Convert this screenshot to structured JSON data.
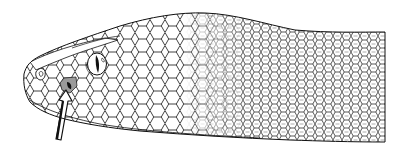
{
  "figure": {
    "subject": "Line drawing of a pit viper head in left profile with an arrow pointing to the loreal heat-sensing pit",
    "style": "black ink line illustration on white background",
    "colors": {
      "background": "#ffffff",
      "ink": "#111111",
      "pit_shading": "#9a9a9a"
    },
    "elements": {
      "head": "snake-head-outline",
      "scales": "scale-pattern",
      "eye": "eye-with-vertical-slit-pupil",
      "pit": "loreal-pit",
      "arrow": "arrow-pointing-to-pit"
    }
  }
}
